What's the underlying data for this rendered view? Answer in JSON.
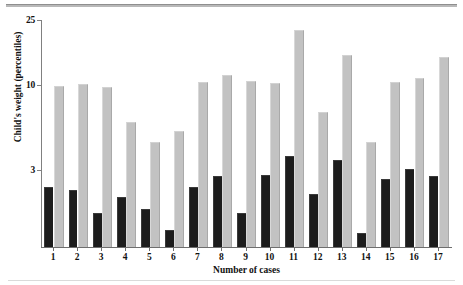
{
  "chart_data": {
    "type": "bar",
    "title": "",
    "xlabel": "Number of cases",
    "ylabel": "Child's weight (percentiles)",
    "categories": [
      "1",
      "2",
      "3",
      "4",
      "5",
      "6",
      "7",
      "8",
      "9",
      "10",
      "11",
      "12",
      "13",
      "14",
      "15",
      "16",
      "17"
    ],
    "yticks": [
      3,
      10,
      25
    ],
    "ytick_labels": [
      "3",
      "10",
      "25"
    ],
    "ylim": [
      1,
      25
    ],
    "yscale": "log",
    "grid": false,
    "legend_position": "none",
    "series": [
      {
        "name": "dark",
        "color": "#1c1c1c",
        "values": [
          2.3,
          2.2,
          1.6,
          2.0,
          1.7,
          1.25,
          2.3,
          2.7,
          1.6,
          2.75,
          3.6,
          2.1,
          3.4,
          1.2,
          2.6,
          3.0,
          2.7
        ]
      },
      {
        "name": "light",
        "color": "#c2c2c2",
        "values": [
          9.7,
          10.0,
          9.5,
          5.8,
          4.4,
          5.1,
          10.2,
          11.3,
          10.4,
          10.1,
          21.5,
          6.7,
          15.0,
          4.4,
          10.2,
          10.8,
          14.6
        ]
      }
    ]
  },
  "axes": {
    "y_title": "Child's weight (percentiles)",
    "x_title": "Number of cases"
  }
}
